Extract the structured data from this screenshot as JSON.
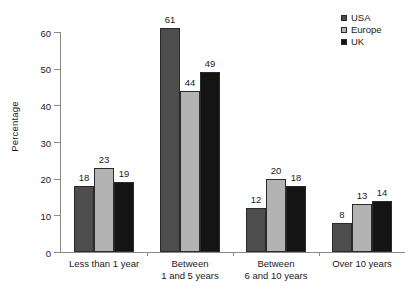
{
  "chart_data": {
    "type": "bar",
    "title": "",
    "subtitle": "",
    "xlabel": "",
    "ylabel": "Percentage",
    "ylim": [
      0,
      60
    ],
    "ytick_values": [
      0,
      10,
      20,
      30,
      40,
      50,
      60
    ],
    "ytick_labels": [
      "0",
      "10",
      "20",
      "30",
      "40",
      "50",
      "60"
    ],
    "grid": false,
    "legend_position": "top-right",
    "categories": [
      "Less than 1 year",
      "Between\n1 and 5 years",
      "Between\n6 and 10 years",
      "Over 10 years"
    ],
    "series": [
      {
        "name": "USA",
        "color": "#4d4d4d",
        "values": [
          18,
          61,
          12,
          8
        ],
        "value_labels": [
          "18",
          "61",
          "12",
          "8"
        ]
      },
      {
        "name": "Europe",
        "color": "#b3b3b3",
        "values": [
          23,
          44,
          20,
          13
        ],
        "value_labels": [
          "23",
          "44",
          "20",
          "13"
        ]
      },
      {
        "name": "UK",
        "color": "#141414",
        "values": [
          19,
          49,
          18,
          14
        ],
        "value_labels": [
          "19",
          "49",
          "18",
          "14"
        ]
      }
    ],
    "axis_color": "#8a8a8a",
    "text_color": "#1a1a1a",
    "background": "#ffffff"
  }
}
